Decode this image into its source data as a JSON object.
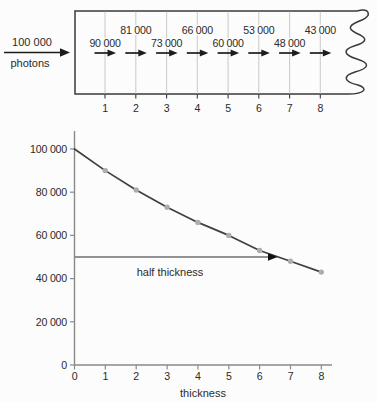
{
  "diagram": {
    "source": {
      "count": "100 000",
      "unit": "photons"
    },
    "layers": [
      {
        "tick": "1",
        "count": "90 000",
        "row": "lower"
      },
      {
        "tick": "2",
        "count": "81 000",
        "row": "upper"
      },
      {
        "tick": "3",
        "count": "73 000",
        "row": "lower"
      },
      {
        "tick": "4",
        "count": "66 000",
        "row": "upper"
      },
      {
        "tick": "5",
        "count": "60 000",
        "row": "lower"
      },
      {
        "tick": "6",
        "count": "53 000",
        "row": "upper"
      },
      {
        "tick": "7",
        "count": "48 000",
        "row": "lower"
      },
      {
        "tick": "8",
        "count": "43 000",
        "row": "upper"
      }
    ]
  },
  "chart_data": {
    "type": "line",
    "title": "",
    "xlabel": "thickness",
    "ylabel": "",
    "x": [
      0,
      1,
      2,
      3,
      4,
      5,
      6,
      7,
      8
    ],
    "series": [
      {
        "name": "photons transmitted",
        "values": [
          100000,
          90000,
          81000,
          73000,
          66000,
          60000,
          53000,
          48000,
          43000
        ]
      }
    ],
    "x_tick_labels": [
      "0",
      "1",
      "2",
      "3",
      "4",
      "5",
      "6",
      "7",
      "8"
    ],
    "y_tick_labels": [
      "0",
      "20 000",
      "40 000",
      "60 000",
      "80 000",
      "100 000"
    ],
    "y_tick_values": [
      0,
      20000,
      40000,
      60000,
      80000,
      100000
    ],
    "xlim": [
      0,
      8.3
    ],
    "ylim": [
      0,
      108000
    ],
    "grid": "off",
    "legend": "none",
    "annotation": {
      "label": "half thickness",
      "y_value": 50000,
      "arrow_points_to_x": 6.5
    }
  },
  "colors": {
    "background": "#fcfcfc",
    "text": "#2b2b2b",
    "box_border": "#3a3a3a",
    "grid_line": "#cdcdcd",
    "photon_arrow": "#1c1c1c",
    "axis": "#8a8a8a",
    "curve": "#3f3f3f",
    "marker": "#adadad",
    "annotation_line": "#6f6f6f"
  }
}
